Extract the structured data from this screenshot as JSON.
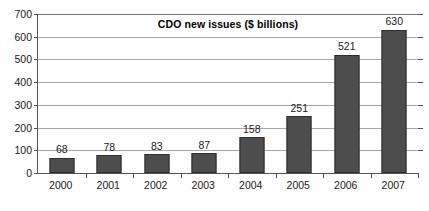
{
  "chart_data": {
    "type": "bar",
    "title": "CDO new issues ($ billions)",
    "xlabel": "",
    "ylabel": "",
    "categories": [
      "2000",
      "2001",
      "2002",
      "2003",
      "2004",
      "2005",
      "2006",
      "2007"
    ],
    "values": [
      68,
      78,
      83,
      87,
      158,
      251,
      521,
      630
    ],
    "value_labels": [
      "68",
      "78",
      "83",
      "87",
      "158",
      "251",
      "521",
      "630"
    ],
    "ylim": [
      0,
      700
    ],
    "ytick_values": [
      0,
      100,
      200,
      300,
      400,
      500,
      600,
      700
    ],
    "ytick_labels": [
      "0",
      "100",
      "200",
      "300",
      "400",
      "500",
      "600",
      "700"
    ],
    "grid": true,
    "legend": false,
    "series_name": "CDO new issues",
    "bar_color": "#4d4d4d",
    "bar_border_color": "#2e2e2e",
    "gridline_color": "#a8a8a8",
    "axis_color": "#555555",
    "background_color": "#ffffff",
    "text_color": "#1a1a1a"
  }
}
